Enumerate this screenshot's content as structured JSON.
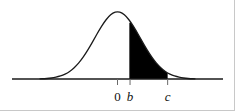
{
  "figure": {
    "title": ""
  },
  "axis": {
    "x_start_px": 12,
    "x_end_px": 223,
    "baseline_y_px": 79,
    "color": "#1a1a1a"
  },
  "ticks": [
    {
      "label": "0",
      "x_px": 118,
      "italic": false
    },
    {
      "label": "b",
      "x_px": 133,
      "italic": true
    },
    {
      "label": "c",
      "x_px": 178,
      "italic": true
    }
  ],
  "shading": {
    "fill_color": "#000000",
    "from_label": "b",
    "to_label": "c"
  },
  "curve": {
    "line_color": "#1a1a1a",
    "peak_x_px": 118,
    "peak_y_px": 8
  },
  "chart_data": {
    "type": "area",
    "title": "",
    "subtitle": "",
    "xlabel": "",
    "ylabel": "",
    "grid": false,
    "legend_position": "none",
    "distribution": "normal",
    "mean": 0,
    "std_dev": 1,
    "xlim": [
      -3.4,
      3.4
    ],
    "ylim": [
      0,
      0.42
    ],
    "tick_labels": [
      "0",
      "b",
      "c"
    ],
    "tick_values": [
      0,
      0.55,
      2.2
    ],
    "shaded_interval": {
      "from": 0.55,
      "to": 2.2,
      "fill": "#000000"
    },
    "x": [
      -3.4,
      -3.2,
      -3.0,
      -2.8,
      -2.6,
      -2.4,
      -2.2,
      -2.0,
      -1.8,
      -1.6,
      -1.4,
      -1.2,
      -1.0,
      -0.8,
      -0.6,
      -0.4,
      -0.2,
      0.0,
      0.2,
      0.4,
      0.6,
      0.8,
      1.0,
      1.2,
      1.4,
      1.6,
      1.8,
      2.0,
      2.2,
      2.4,
      2.6,
      2.8,
      3.0,
      3.2,
      3.4
    ],
    "y": [
      0.001,
      0.002,
      0.004,
      0.008,
      0.014,
      0.022,
      0.035,
      0.054,
      0.079,
      0.111,
      0.15,
      0.194,
      0.242,
      0.29,
      0.333,
      0.368,
      0.391,
      0.399,
      0.391,
      0.368,
      0.333,
      0.29,
      0.242,
      0.194,
      0.15,
      0.111,
      0.079,
      0.054,
      0.035,
      0.022,
      0.014,
      0.008,
      0.004,
      0.002,
      0.001
    ]
  }
}
